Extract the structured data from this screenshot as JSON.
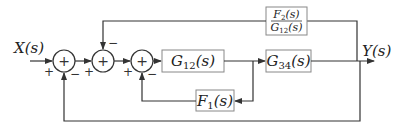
{
  "diagram": {
    "type": "block-diagram",
    "input_label": "X(s)",
    "output_label": "Y(s)",
    "colors": {
      "line": "#333333",
      "box_border": "#888888",
      "background": "#ffffff"
    },
    "blocks": [
      {
        "id": "G12",
        "main": "G",
        "sub": "12",
        "arg": "(s)"
      },
      {
        "id": "G34",
        "main": "G",
        "sub": "34",
        "arg": "(s)"
      },
      {
        "id": "F1",
        "main": "F",
        "sub": "1",
        "arg": "(s)"
      },
      {
        "id": "F2_over_G12",
        "num_main": "F",
        "num_sub": "2",
        "num_arg": "(s)",
        "den_main": "G",
        "den_sub": "12",
        "den_arg": "(s)"
      }
    ],
    "summing_junctions": [
      {
        "id": "S1",
        "symbol": "+",
        "input_signs": {
          "left": "+",
          "bottom": "−"
        }
      },
      {
        "id": "S2",
        "symbol": "+",
        "input_signs": {
          "left": "+",
          "top": "−"
        }
      },
      {
        "id": "S3",
        "symbol": "+",
        "input_signs": {
          "left": "+",
          "bottom": "−"
        }
      }
    ],
    "connections": [
      "X(s) -> S1 (+)",
      "S1 -> S2 (+)",
      "S2 -> S3 (+)",
      "S3 -> G12(s)",
      "G12(s) -> G34(s)",
      "G12(s) output -> F1(s) -> S3 (−)",
      "G34(s) -> Y(s)",
      "Y(s) -> F2(s)/G12(s) -> S2 (−)",
      "Y(s) -> S1 (−)"
    ]
  }
}
